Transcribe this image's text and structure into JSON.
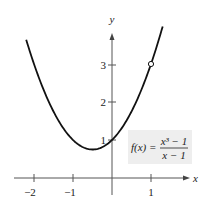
{
  "chart_data": {
    "type": "line",
    "title": "",
    "function_label": {
      "lhs": "f(x) =",
      "numerator": "x³ − 1",
      "denominator": "x − 1"
    },
    "xlabel": "x",
    "ylabel": "y",
    "xlim": [
      -2.3,
      1.35
    ],
    "ylim": [
      -0.3,
      4.0
    ],
    "x_ticks": [
      {
        "value": -2,
        "label": "−2"
      },
      {
        "value": -1,
        "label": "−1"
      },
      {
        "value": 1,
        "label": "1"
      }
    ],
    "y_ticks": [
      {
        "value": 1,
        "label": "1"
      },
      {
        "value": 2,
        "label": "2"
      },
      {
        "value": 3,
        "label": "3"
      }
    ],
    "grid": false,
    "series": [
      {
        "name": "f(x) = (x^3 - 1)/(x - 1)",
        "equivalent": "x^2 + x + 1, x ≠ 1",
        "x": [
          -2.2,
          -2.0,
          -1.5,
          -1.0,
          -0.5,
          0.0,
          0.5,
          1.0,
          1.3
        ],
        "y": [
          3.64,
          3.0,
          1.75,
          1.0,
          0.75,
          1.0,
          1.75,
          3.0,
          3.99
        ]
      }
    ],
    "annotations": [
      {
        "type": "open-circle",
        "x": 1,
        "y": 3,
        "meaning": "hole (undefined at x = 1)"
      }
    ]
  }
}
